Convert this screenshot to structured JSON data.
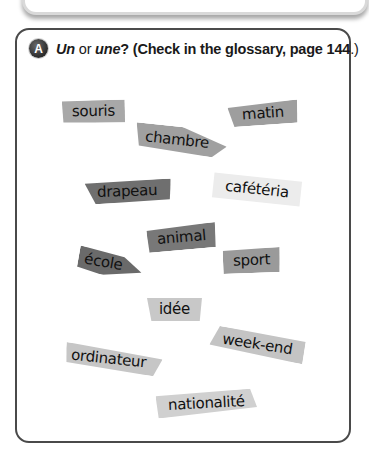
{
  "exercise": {
    "badge": "A",
    "instruction": {
      "un": "Un",
      "or": " or ",
      "une": "une",
      "rest": "? (Check in the glossary, page ",
      "page": "144",
      "end": ".)"
    }
  },
  "words": [
    {
      "text": "souris",
      "color": "#a8a8a8"
    },
    {
      "text": "chambre",
      "color": "#a0a0a0"
    },
    {
      "text": "matin",
      "color": "#9e9e9e"
    },
    {
      "text": "drapeau",
      "color": "#6f6f6f"
    },
    {
      "text": "cafétéria",
      "color": "#e8e8e8"
    },
    {
      "text": "animal",
      "color": "#787878"
    },
    {
      "text": "école",
      "color": "#6a6a6a"
    },
    {
      "text": "sport",
      "color": "#9a9a9a"
    },
    {
      "text": "idée",
      "color": "#c8c8c8"
    },
    {
      "text": "week-end",
      "color": "#c4c4c4"
    },
    {
      "text": "ordinateur",
      "color": "#c6c6c6"
    },
    {
      "text": "nationalité",
      "color": "#d0d0d0"
    }
  ]
}
